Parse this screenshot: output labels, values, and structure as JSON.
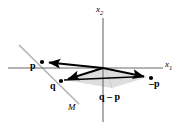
{
  "figure": {
    "background_color": "#ffffff",
    "axis_color": "#5a5a5a",
    "vector_color": "#000000",
    "subspace_line_color": "#b0b0b0",
    "shade_color": "#d8d8d8",
    "width": 185,
    "height": 131
  },
  "axes": {
    "x_label": "x",
    "x_sub": "1",
    "y_label": "x",
    "y_sub": "2",
    "origin": {
      "x": 103,
      "y": 68
    },
    "x_axis": {
      "x1": 8,
      "y1": 68,
      "x2": 163,
      "y2": 68
    },
    "y_axis": {
      "x1": 103,
      "y1": 18,
      "x2": 103,
      "y2": 122
    },
    "x_label_pos": {
      "x": 166,
      "y": 61
    },
    "y_label_pos": {
      "x": 98,
      "y": 6
    }
  },
  "subspace": {
    "name": "M",
    "label": "M",
    "label_pos": {
      "x": 69,
      "y": 105
    },
    "line": {
      "x1": 19,
      "y1": 45,
      "x2": 79,
      "y2": 104
    }
  },
  "points": [
    {
      "id": "p",
      "label": "p",
      "dot": {
        "x": 42,
        "y": 62
      },
      "label_pos": {
        "x": 31,
        "y": 63
      }
    },
    {
      "id": "q",
      "label": "q",
      "dot": {
        "x": 61,
        "y": 81
      },
      "label_pos": {
        "x": 51,
        "y": 82
      }
    },
    {
      "id": "neg-p",
      "label": "–p",
      "dot": {
        "x": 151,
        "y": 78
      },
      "label_pos": {
        "x": 150,
        "y": 80
      }
    }
  ],
  "vectors": [
    {
      "id": "vector-p",
      "from": {
        "x": 103,
        "y": 68
      },
      "to": {
        "x": 45,
        "y": 62
      },
      "label": "p"
    },
    {
      "id": "vector-q",
      "from": {
        "x": 103,
        "y": 68
      },
      "to": {
        "x": 64,
        "y": 80
      },
      "label": "q"
    },
    {
      "id": "vector-neg-p",
      "from": {
        "x": 103,
        "y": 68
      },
      "to": {
        "x": 148,
        "y": 77
      },
      "label": "–p"
    }
  ],
  "difference": {
    "id": "q-minus-p",
    "label": "q – p",
    "label_pos": {
      "x": 100,
      "y": 93
    },
    "segment": {
      "x1": 64,
      "y1": 80,
      "x2": 148,
      "y2": 77
    }
  },
  "shaded_region": {
    "id": "parallelogram-shade",
    "points": "103,68 64,80 112,88 148,77",
    "fill": "#dcdcdc"
  },
  "leader_line": {
    "id": "q-minus-p-leader",
    "x1": 112,
    "y1": 88,
    "x2": 106,
    "y2": 70
  }
}
